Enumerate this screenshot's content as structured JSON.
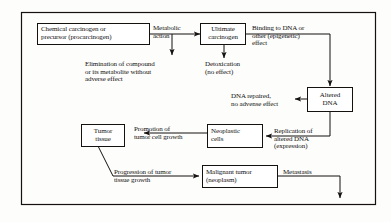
{
  "diagram": {
    "border_color": "#14110f",
    "background_color": "#fdfdfb",
    "text_color": "#111111",
    "nodes": [
      {
        "id": "chemical-carcinogen",
        "lines": [
          "Chemical carcinogen or",
          "precursor (procarcinogen)"
        ],
        "align": "left"
      },
      {
        "id": "ultimate-carcinogen",
        "lines": [
          "Ultimate",
          "carcinogen"
        ],
        "align": "center"
      },
      {
        "id": "altered-dna",
        "lines": [
          "Altered",
          "DNA"
        ],
        "align": "center"
      },
      {
        "id": "neoplastic-cells",
        "lines": [
          "Neoplastic",
          "cells"
        ],
        "align": "left"
      },
      {
        "id": "tumor-tissue",
        "lines": [
          "Tumor",
          "tissue"
        ],
        "align": "center"
      },
      {
        "id": "malignant-tumor",
        "lines": [
          "Malignant tumor",
          "(neoplasm)"
        ],
        "align": "left"
      }
    ],
    "edge_labels": [
      {
        "id": "metabolic-action",
        "lines": [
          "Metabolic",
          "action"
        ]
      },
      {
        "id": "binding-to-dna",
        "lines": [
          "Binding to DNA or",
          "other (epigenetic)",
          "effect"
        ]
      },
      {
        "id": "elimination-of-compound",
        "lines": [
          "Elimination of compound",
          "or its metabolite without",
          "adverse effect"
        ]
      },
      {
        "id": "detoxication",
        "lines": [
          "Detoxication",
          "(no effect)"
        ]
      },
      {
        "id": "dna-repaired",
        "lines": [
          "DNA repaired,",
          "no advense effect"
        ]
      },
      {
        "id": "replication-of-altered-dna",
        "lines": [
          "Replication of",
          "altered DNA",
          "(expression)"
        ]
      },
      {
        "id": "promotion-of-tumor-cell-growth",
        "lines": [
          "Promotion of",
          "tumor cell growth"
        ]
      },
      {
        "id": "progression-of-tumor",
        "lines": [
          "Progression of tumor",
          "tissue growth"
        ]
      },
      {
        "id": "metastasis",
        "lines": [
          "Metastasis"
        ]
      }
    ]
  }
}
